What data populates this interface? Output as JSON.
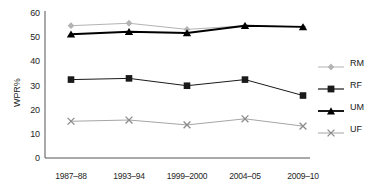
{
  "chart_data": {
    "type": "line",
    "title": "",
    "xlabel": "",
    "ylabel": "WPR%",
    "ylim": [
      0,
      60
    ],
    "yticks": [
      0,
      10,
      20,
      30,
      40,
      50,
      60
    ],
    "grid": false,
    "legend_position": "right",
    "categories": [
      "1987–88",
      "1993–94",
      "1999–2000",
      "2004–05",
      "2009–10"
    ],
    "series": [
      {
        "name": "RM",
        "marker": "diamond",
        "color": "#b3b3b3",
        "values": [
          54,
          55,
          52.5,
          54,
          53.5
        ]
      },
      {
        "name": "RF",
        "marker": "square",
        "color": "#1a1a1a",
        "values": [
          32,
          32.5,
          29.5,
          32,
          25.5
        ]
      },
      {
        "name": "UM",
        "marker": "triangle",
        "color": "#000000",
        "values": [
          50.5,
          51.5,
          51,
          54,
          53.5
        ]
      },
      {
        "name": "UF",
        "marker": "x",
        "color": "#a6a6a6",
        "values": [
          15,
          15.5,
          13.5,
          16,
          13
        ]
      }
    ]
  },
  "axis": {
    "y_tick_labels": [
      "60",
      "50",
      "40",
      "30",
      "20",
      "10",
      "0"
    ],
    "y_axis_title": "WPR%",
    "x_tick_labels": [
      "1987–88",
      "1993–94",
      "1999–2000",
      "2004–05",
      "2009–10"
    ]
  },
  "legend": {
    "items": [
      {
        "label": "RM"
      },
      {
        "label": "RF"
      },
      {
        "label": "UM"
      },
      {
        "label": "UF"
      }
    ]
  }
}
